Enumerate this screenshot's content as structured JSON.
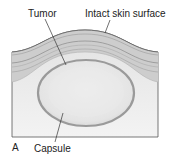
{
  "figure": {
    "panel_label": "A",
    "labels": {
      "tumor": "Tumor",
      "skin": "Intact skin surface",
      "capsule": "Capsule"
    }
  },
  "colors": {
    "frame_fill": "#e6e6e6",
    "skin_band": "#cfcfcf",
    "skin_line": "#8a8a8a",
    "tumor_fill": "#ebebeb",
    "capsule_stroke": "#9a9a9a",
    "outline": "#555555"
  }
}
